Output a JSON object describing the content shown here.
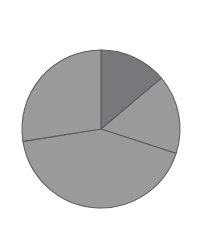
{
  "figure": {
    "background_color": "#ffffff",
    "width": 213,
    "height": 240
  },
  "chart_data": {
    "type": "pie",
    "title": "",
    "xlabel": "",
    "ylabel": "",
    "grid": false,
    "legend": "none",
    "labels_visible": false,
    "slice_labels": [
      "",
      "",
      "",
      ""
    ],
    "values": [
      13.9,
      16.1,
      42.5,
      27.5
    ],
    "angles_deg": [
      50,
      58,
      153,
      99
    ],
    "start_angle_deg": 90,
    "direction": "clockwise",
    "colors": [
      "#78787a",
      "#9a9a9a",
      "#9a9a9a",
      "#9a9a9a"
    ],
    "edge_color": "#5d5d5f",
    "edge_width": 1.05,
    "geometry": {
      "center_x": 101,
      "center_y": 129,
      "radius": 79,
      "boundary_angles_deg": [
        90,
        40,
        -18,
        -171
      ]
    }
  }
}
